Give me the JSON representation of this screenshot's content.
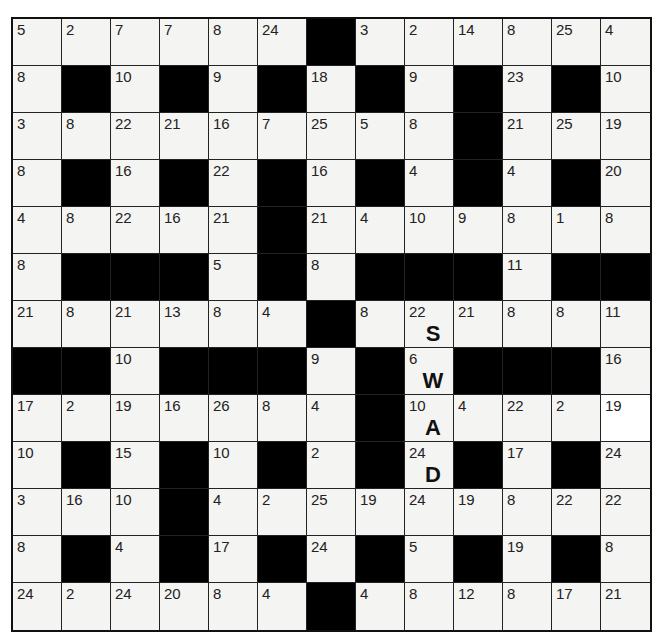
{
  "puzzle": {
    "type": "codeword",
    "rows": 13,
    "cols": 13,
    "grid": [
      [
        5,
        2,
        7,
        7,
        8,
        24,
        null,
        3,
        2,
        14,
        8,
        25,
        4
      ],
      [
        8,
        null,
        10,
        null,
        9,
        null,
        18,
        null,
        9,
        null,
        23,
        null,
        10
      ],
      [
        3,
        8,
        22,
        21,
        16,
        7,
        25,
        5,
        8,
        null,
        21,
        25,
        19
      ],
      [
        8,
        null,
        16,
        null,
        22,
        null,
        16,
        null,
        4,
        null,
        4,
        null,
        20
      ],
      [
        4,
        8,
        22,
        16,
        21,
        null,
        21,
        4,
        10,
        9,
        8,
        1,
        8
      ],
      [
        8,
        null,
        null,
        null,
        5,
        null,
        8,
        null,
        null,
        null,
        11,
        null,
        null
      ],
      [
        21,
        8,
        21,
        13,
        8,
        4,
        null,
        8,
        22,
        21,
        8,
        8,
        11
      ],
      [
        null,
        null,
        10,
        null,
        null,
        null,
        9,
        null,
        6,
        null,
        null,
        null,
        16
      ],
      [
        17,
        2,
        19,
        16,
        26,
        8,
        4,
        null,
        10,
        4,
        22,
        2,
        19
      ],
      [
        10,
        null,
        15,
        null,
        10,
        null,
        2,
        null,
        24,
        null,
        17,
        null,
        24
      ],
      [
        3,
        16,
        10,
        null,
        4,
        2,
        25,
        19,
        24,
        19,
        8,
        22,
        22
      ],
      [
        8,
        null,
        4,
        null,
        17,
        null,
        24,
        null,
        5,
        null,
        19,
        null,
        8
      ],
      [
        24,
        2,
        24,
        20,
        8,
        4,
        null,
        4,
        8,
        12,
        8,
        17,
        21
      ]
    ],
    "given_letters": [
      {
        "row": 6,
        "col": 8,
        "number": 22,
        "letter": "S"
      },
      {
        "row": 7,
        "col": 8,
        "number": 6,
        "letter": "W"
      },
      {
        "row": 8,
        "col": 8,
        "number": 10,
        "letter": "A"
      },
      {
        "row": 9,
        "col": 8,
        "number": 24,
        "letter": "D"
      }
    ]
  },
  "colors": {
    "black_cell": "#000000",
    "white_cell": "#f4f4f2",
    "grid_line": "#222222"
  }
}
